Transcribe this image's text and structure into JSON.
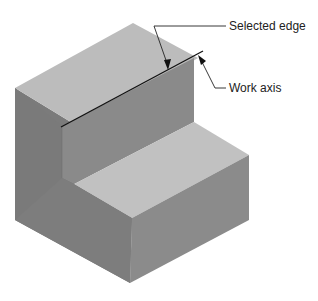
{
  "figure": {
    "labels": {
      "selected_edge": "Selected edge",
      "work_axis": "Work axis"
    },
    "colors": {
      "top_face": "#bdbdbd",
      "left_face": "#7c7c7c",
      "right_face": "#8e8e8e",
      "step_riser": "#8a8a8a",
      "step_top": "#c2c2c2",
      "edge_line": "#111111",
      "leader_line": "#222222"
    }
  }
}
